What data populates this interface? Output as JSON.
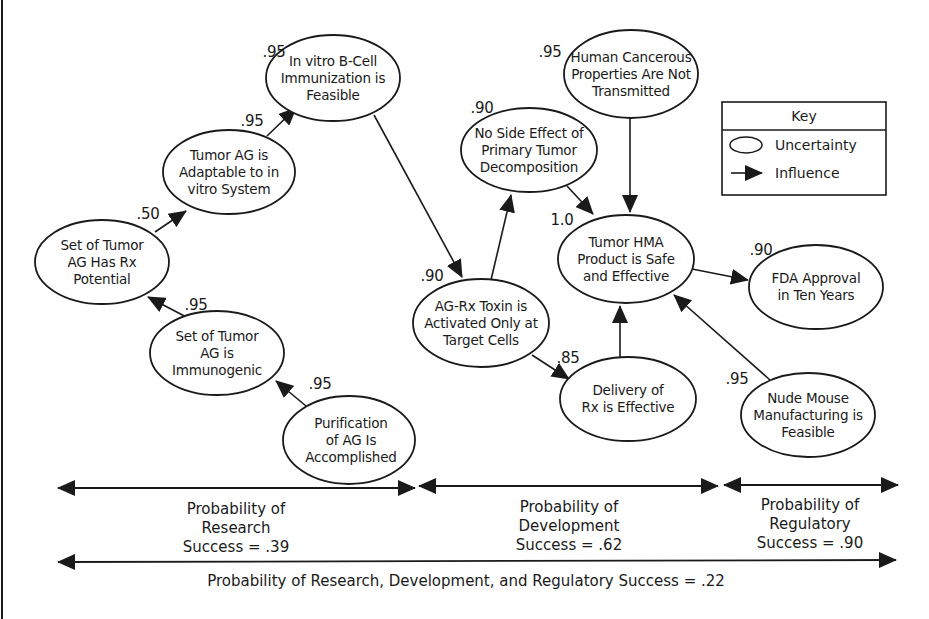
{
  "diagram": {
    "type": "influence-diagram",
    "nodes": [
      {
        "id": "tumor-ag-rx-potential",
        "label": "Set of Tumor\nAG Has Rx\nPotential",
        "probability": ".50",
        "cx": 102,
        "cy": 262
      },
      {
        "id": "tumor-ag-adaptable",
        "label": "Tumor AG is\nAdaptable to in\nvitro System",
        "probability": ".95",
        "cx": 229,
        "cy": 172
      },
      {
        "id": "b-cell-immunization",
        "label": "In vitro B-Cell\nImmunization is\nFeasible",
        "probability": ".95",
        "cx": 333,
        "cy": 78
      },
      {
        "id": "tumor-ag-immunogenic",
        "label": "Set of Tumor\nAG is\nImmunogenic",
        "probability": ".95",
        "cx": 217,
        "cy": 353
      },
      {
        "id": "purification-of-ag",
        "label": "Purification\nof AG Is\nAccomplished",
        "probability": ".95",
        "cx": 347,
        "cy": 440
      },
      {
        "id": "no-side-effect",
        "label": "No Side Effect of\nPrimary Tumor\nDecomposition",
        "probability": ".90",
        "cx": 529,
        "cy": 150
      },
      {
        "id": "human-cancerous-properties",
        "label": "Human Cancerous\nProperties Are Not\nTransmitted",
        "probability": ".95",
        "cx": 630,
        "cy": 74
      },
      {
        "id": "tumor-hma-product",
        "label": "Tumor HMA\nProduct is Safe\nand Effective",
        "probability": "1.0",
        "cx": 626,
        "cy": 259
      },
      {
        "id": "ag-rx-toxin",
        "label": "AG-Rx Toxin is\nActivated Only at\nTarget Cells",
        "probability": ".90",
        "cx": 481,
        "cy": 323
      },
      {
        "id": "delivery-of-rx",
        "label": "Delivery of\nRx is Effective",
        "probability": ".85",
        "cx": 628,
        "cy": 398
      },
      {
        "id": "fda-approval",
        "label": "FDA Approval\nin Ten Years",
        "probability": ".90",
        "cx": 816,
        "cy": 287
      },
      {
        "id": "nude-mouse-manufacturing",
        "label": "Nude Mouse\nManufacturing is\nFeasible",
        "probability": ".95",
        "cx": 808,
        "cy": 415
      }
    ],
    "edges": [
      {
        "from": "tumor-ag-immunogenic",
        "to": "tumor-ag-rx-potential"
      },
      {
        "from": "purification-of-ag",
        "to": "tumor-ag-immunogenic"
      },
      {
        "from": "tumor-ag-rx-potential",
        "to": "tumor-ag-adaptable"
      },
      {
        "from": "tumor-ag-adaptable",
        "to": "b-cell-immunization"
      },
      {
        "from": "b-cell-immunization",
        "to": "ag-rx-toxin"
      },
      {
        "from": "ag-rx-toxin",
        "to": "no-side-effect"
      },
      {
        "from": "ag-rx-toxin",
        "to": "delivery-of-rx"
      },
      {
        "from": "no-side-effect",
        "to": "tumor-hma-product"
      },
      {
        "from": "human-cancerous-properties",
        "to": "tumor-hma-product"
      },
      {
        "from": "delivery-of-rx",
        "to": "tumor-hma-product"
      },
      {
        "from": "nude-mouse-manufacturing",
        "to": "tumor-hma-product"
      },
      {
        "from": "tumor-hma-product",
        "to": "fda-approval"
      }
    ],
    "labels": {
      "n0": "Set of Tumor\nAG Has Rx\nPotential",
      "n1": "Tumor AG is\nAdaptable to in\nvitro System",
      "n2": "In vitro B-Cell\nImmunization is\nFeasible",
      "n3": "Set of Tumor\nAG is\nImmunogenic",
      "n4": "Purification\nof AG Is\nAccomplished",
      "n5": "No Side Effect of\nPrimary Tumor\nDecomposition",
      "n6": "Human Cancerous\nProperties Are Not\nTransmitted",
      "n7": "Tumor HMA\nProduct is Safe\nand Effective",
      "n8": "AG-Rx Toxin is\nActivated Only at\nTarget Cells",
      "n9": "Delivery of\nRx is Effective",
      "n10": "FDA Approval\nin Ten Years",
      "n11": "Nude Mouse\nManufacturing is\nFeasible"
    },
    "probabilities": {
      "n0": ".50",
      "n1": ".95",
      "n2": ".95",
      "n3": ".95",
      "n4": ".95",
      "n5": ".90",
      "n6": ".95",
      "n7": "1.0",
      "n8": ".90",
      "n9": ".85",
      "n10": ".90",
      "n11": ".95"
    }
  },
  "key": {
    "title": "Key",
    "items": [
      {
        "symbol": "ellipse",
        "label": "Uncertainty"
      },
      {
        "symbol": "arrow",
        "label": "Influence"
      }
    ]
  },
  "phases": [
    {
      "name": "research",
      "label": "Probability of\nResearch\nSuccess = .39",
      "value": ".39"
    },
    {
      "name": "development",
      "label": "Probability of\nDevelopment\nSuccess = .62",
      "value": ".62"
    },
    {
      "name": "regulatory",
      "label": "Probability of\nRegulatory\nSuccess = .90",
      "value": ".90"
    }
  ],
  "overall": {
    "label": "Probability of Research, Development, and Regulatory Success = .22",
    "value": ".22"
  },
  "colors": {
    "ink": "#1a1a1a",
    "background": "#ffffff"
  }
}
